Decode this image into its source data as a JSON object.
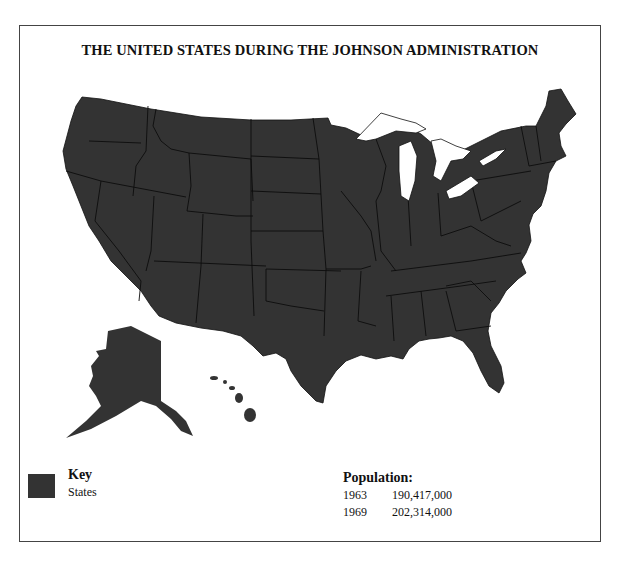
{
  "title": "THE UNITED STATES DURING THE JOHNSON ADMINISTRATION",
  "colors": {
    "land": "#333333",
    "border": "#111111",
    "water": "#ffffff",
    "frame": "#444444"
  },
  "key": {
    "heading": "Key",
    "items": [
      {
        "label": "States",
        "swatch": "#333333"
      }
    ]
  },
  "population": {
    "heading": "Population:",
    "rows": [
      {
        "year": "1963",
        "value": "190,417,000"
      },
      {
        "year": "1969",
        "value": "202,314,000"
      }
    ]
  },
  "map_regions": [
    "contiguous-us",
    "alaska",
    "hawaii",
    "great-lakes"
  ]
}
